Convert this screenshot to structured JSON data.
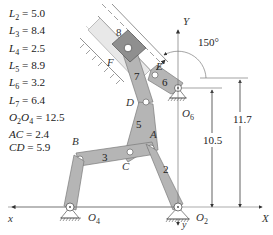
{
  "diagram": {
    "parameters": [
      {
        "name": "L2",
        "symbol": "L",
        "sub": "2",
        "value": "5.0"
      },
      {
        "name": "L3",
        "symbol": "L",
        "sub": "3",
        "value": "8.4"
      },
      {
        "name": "L4",
        "symbol": "L",
        "sub": "4",
        "value": "2.5"
      },
      {
        "name": "L5",
        "symbol": "L",
        "sub": "5",
        "value": "8.9"
      },
      {
        "name": "L6",
        "symbol": "L",
        "sub": "6",
        "value": "3.2"
      },
      {
        "name": "L7",
        "symbol": "L",
        "sub": "7",
        "value": "6.4"
      },
      {
        "name": "O2O4",
        "symbol": "O2O4",
        "sub": "",
        "value": "12.5"
      },
      {
        "name": "AC",
        "symbol": "AC",
        "sub": "",
        "value": "2.4"
      },
      {
        "name": "CD",
        "symbol": "CD",
        "sub": "",
        "value": "5.9"
      }
    ],
    "param_lines": [
      "L2 = 5.0",
      "L3 = 8.4",
      "L4 = 2.5",
      "L5 = 8.9",
      "L6 = 3.2",
      "L7 = 6.4",
      "O2O4 = 12.5",
      "AC = 2.4",
      "CD = 5.9"
    ],
    "points": {
      "A": "A",
      "B": "B",
      "C": "C",
      "D": "D",
      "E": "E",
      "F": "F",
      "O2": "O2",
      "O4": "O4",
      "O6": "O6"
    },
    "links": {
      "l2": "2",
      "l3": "3",
      "l5": "5",
      "l6": "6",
      "l7": "7",
      "l8": "8"
    },
    "axes": {
      "X": "X",
      "Y": "Y",
      "x": "x",
      "y": "y"
    },
    "angle": "150°",
    "dimensions": {
      "d1": "10.5",
      "d2": "11.7"
    },
    "colors": {
      "link_fill": "#b5b5b5",
      "link_stroke": "#7a7a7a",
      "slider_fill": "#8f8f8f",
      "line": "#555555",
      "text": "#333333"
    }
  }
}
